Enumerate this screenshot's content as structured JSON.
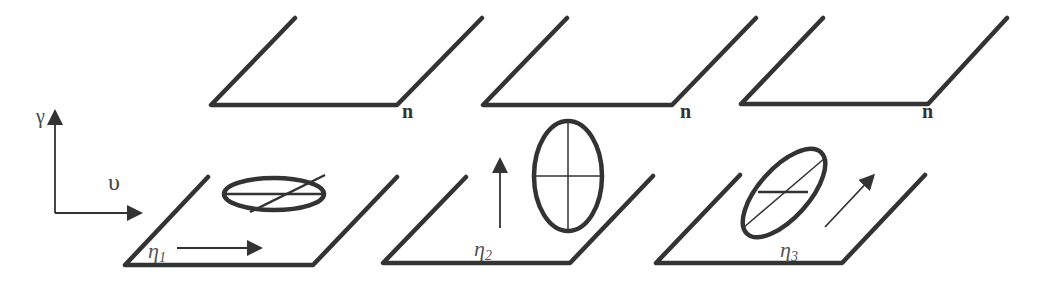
{
  "figure": {
    "axes": {
      "vertical_label": "γ",
      "horizontal_label": "υ"
    },
    "top_planes": [
      {
        "label": "n"
      },
      {
        "label": "n"
      },
      {
        "label": "n"
      }
    ],
    "bottom_planes": [
      {
        "symbol": "η",
        "subscript": "1",
        "ellipse": "horizontal",
        "arrow": "right"
      },
      {
        "symbol": "η",
        "subscript": "2",
        "ellipse": "vertical",
        "arrow": "up"
      },
      {
        "symbol": "η",
        "subscript": "3",
        "ellipse": "tilted",
        "arrow": "diagonal"
      }
    ],
    "colors": {
      "stroke": "#333333",
      "background": "#ffffff"
    }
  }
}
